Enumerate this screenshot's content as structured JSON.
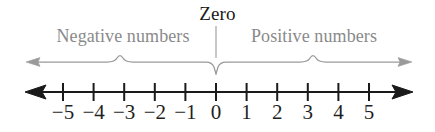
{
  "figure": {
    "width": 435,
    "height": 132,
    "background_color": "#ffffff"
  },
  "labels": {
    "zero": "Zero",
    "negative": "Negative numbers",
    "positive": "Positive numbers"
  },
  "colors": {
    "line": "#1a1a1a",
    "brace": "#8a8a8a",
    "label_gray": "#8a8a8a",
    "label_dark": "#1a1a1a",
    "tick_label": "#1f1f1f",
    "background": "#ffffff"
  },
  "chart_data": {
    "type": "line",
    "xlabel": "",
    "ylabel": "",
    "xlim": [
      -5.5,
      5.5
    ],
    "grid": false,
    "legend": false,
    "tick_values": [
      -5,
      -4,
      -3,
      -2,
      -1,
      0,
      1,
      2,
      3,
      4,
      5
    ],
    "tick_labels": [
      "−5",
      "−4",
      "−3",
      "−2",
      "−1",
      "0",
      "1",
      "2",
      "3",
      "4",
      "5"
    ],
    "annotations": [
      {
        "text": "Zero",
        "value": 0
      },
      {
        "text": "Negative numbers",
        "range": [
          -5.5,
          0
        ]
      },
      {
        "text": "Positive numbers",
        "range": [
          0,
          5.5
        ]
      }
    ],
    "axis_arrows": {
      "left": true,
      "right": true
    }
  },
  "geometry": {
    "tick_x": [
      63,
      93.6,
      124.2,
      154.8,
      185.4,
      216,
      246.6,
      277.2,
      307.8,
      338.4,
      369
    ],
    "axis_y": 92,
    "axis_left_x": 26,
    "axis_right_x": 412,
    "brace_y": 62,
    "brace_left_x": 26,
    "brace_right_x": 412,
    "brace_center_x": 216
  }
}
